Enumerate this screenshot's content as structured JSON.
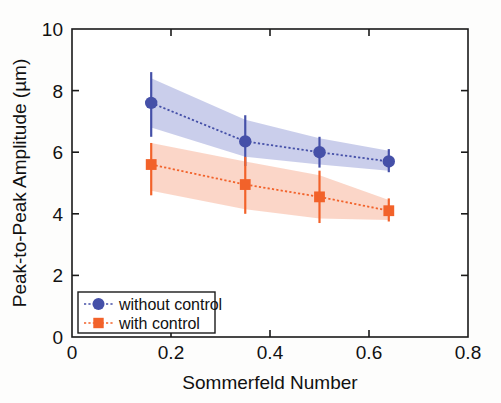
{
  "chart_data": {
    "type": "line",
    "title": "",
    "xlabel": "Sommerfeld Number",
    "ylabel": "Peak-to-Peak Amplitude (µm)",
    "xlim": [
      0,
      0.8
    ],
    "ylim": [
      0,
      10
    ],
    "xticks": [
      "0",
      "0.2",
      "0.4",
      "0.6",
      "0.8"
    ],
    "xtick_values": [
      0,
      0.2,
      0.4,
      0.6,
      0.8
    ],
    "yticks": [
      "0",
      "2",
      "4",
      "6",
      "8",
      "10"
    ],
    "ytick_values": [
      0,
      2,
      4,
      6,
      8,
      10
    ],
    "grid": false,
    "legend_position": "lower-left",
    "x": [
      0.16,
      0.35,
      0.5,
      0.64
    ],
    "series": [
      {
        "name": "without control",
        "color": "#4550a8",
        "band_color": "#aab0de",
        "marker": "circle",
        "values": [
          7.6,
          6.35,
          6.0,
          5.7
        ],
        "errors_low": [
          6.5,
          5.55,
          5.5,
          5.35
        ],
        "errors_high": [
          8.6,
          7.2,
          6.5,
          6.1
        ],
        "band_low": [
          6.8,
          5.85,
          5.6,
          5.4
        ],
        "band_high": [
          8.4,
          7.05,
          6.45,
          6.05
        ]
      },
      {
        "name": "with control",
        "color": "#f2622a",
        "band_color": "#f8bda6",
        "marker": "square",
        "values": [
          5.6,
          4.95,
          4.55,
          4.1
        ],
        "errors_low": [
          4.6,
          4.0,
          3.7,
          3.75
        ],
        "errors_high": [
          6.3,
          5.85,
          5.4,
          4.5
        ],
        "band_low": [
          4.75,
          4.15,
          3.85,
          3.8
        ],
        "band_high": [
          6.3,
          5.7,
          5.25,
          4.45
        ]
      }
    ]
  },
  "axes": {
    "x_title": "Sommerfeld Number",
    "y_title": "Peak-to-Peak Amplitude (µm)"
  },
  "legend": {
    "entries": [
      {
        "label": "without control"
      },
      {
        "label": "with control"
      }
    ]
  },
  "colors": {
    "series1": "#4550a8",
    "series1_band": "#aab0de",
    "series2": "#f2622a",
    "series2_band": "#f8bda6",
    "axis": "#1a1a1a",
    "text": "#111111",
    "background": "#fdfdfc"
  }
}
